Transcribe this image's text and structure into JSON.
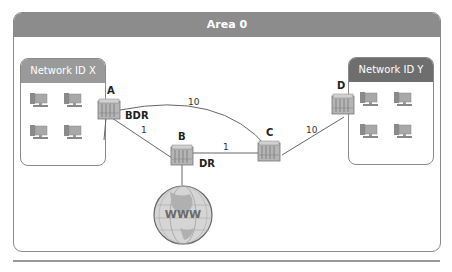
{
  "area": {
    "title": "Area 0"
  },
  "networks": [
    {
      "id": "x",
      "title": "Network ID X",
      "hosts": 4
    },
    {
      "id": "y",
      "title": "Network ID Y",
      "hosts": 4
    }
  ],
  "routers": [
    {
      "name": "A",
      "role": "BDR"
    },
    {
      "name": "B",
      "role": "DR"
    },
    {
      "name": "C",
      "role": ""
    },
    {
      "name": "D",
      "role": ""
    }
  ],
  "links": [
    {
      "from": "A",
      "to": "C",
      "cost": "10"
    },
    {
      "from": "A",
      "to": "B",
      "cost": "1"
    },
    {
      "from": "B",
      "to": "C",
      "cost": "1"
    },
    {
      "from": "C",
      "to": "D",
      "cost": "10"
    },
    {
      "from": "B",
      "to": "Internet",
      "cost": ""
    }
  ],
  "internet": {
    "label": "WWW"
  },
  "colors": {
    "header": "#8c8c8c",
    "network_x_header": "#9a9a9a",
    "network_y_header": "#6e6e6e",
    "border": "#8a8a8a"
  }
}
